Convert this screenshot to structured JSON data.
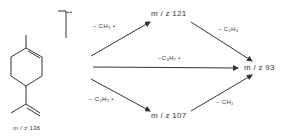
{
  "molecule": {
    "name_label": "m / z 136",
    "charge_label": "+•"
  },
  "nodes": {
    "m121": "m / z 121",
    "m93": "m / z 93",
    "m107": "m / z 107"
  },
  "edges": {
    "loss_ch3_radical": "− CH₃ •",
    "loss_c3h7_radical": "−C₃H₇ •",
    "loss_c2h5_radical": "− C₂H₅ •",
    "loss_c2h4": "− C₂H₄",
    "loss_ch2": "− CH₂"
  },
  "colors": {
    "line": "#333333",
    "background": "#ffffff"
  }
}
